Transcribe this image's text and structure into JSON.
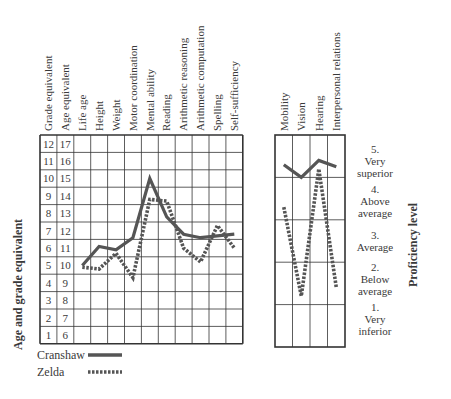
{
  "chart_data": [
    {
      "type": "line",
      "title": "",
      "ylabel": "Age and grade equivalent",
      "y_axis_grade_ticks": [
        "12",
        "11",
        "10",
        "9",
        "8",
        "7",
        "6",
        "5",
        "4",
        "3",
        "2",
        "1"
      ],
      "y_axis_age_ticks": [
        "17",
        "16",
        "15",
        "14",
        "13",
        "12",
        "11",
        "10",
        "9",
        "8",
        "7",
        "6"
      ],
      "categories": [
        "Life age",
        "Height",
        "Weight",
        "Motor coordination",
        "Mental ability",
        "Reading",
        "Arithmetic reasoning",
        "Arithmetic computation",
        "Spelling",
        "Self-sufficiency"
      ],
      "column_headers": [
        "Grade equivalent",
        "Age equivalent",
        "Life age",
        "Height",
        "Weight",
        "Motor coordination",
        "Mental ability",
        "Reading",
        "Arithmetic reasoning",
        "Arithmetic computation",
        "Spelling",
        "Self-sufficiency"
      ],
      "ylim_age": [
        5.5,
        17.5
      ],
      "series": [
        {
          "name": "Cranshaw",
          "style": "solid",
          "values": [
            10.0,
            11.1,
            10.9,
            11.6,
            15.0,
            12.8,
            11.8,
            11.6,
            11.7,
            11.8
          ]
        },
        {
          "name": "Zelda",
          "style": "dashed",
          "values": [
            9.9,
            9.8,
            10.7,
            9.3,
            13.8,
            13.7,
            11.0,
            10.2,
            12.3,
            11.0
          ]
        }
      ],
      "grid": true,
      "legend_position": "bottom-left"
    },
    {
      "type": "line",
      "ylabel": "Proficiency level",
      "categories": [
        "Mobility",
        "Vision",
        "Hearing",
        "Interpersonal relations"
      ],
      "levels": [
        {
          "num": "5.",
          "label": [
            "Very",
            "superior"
          ]
        },
        {
          "num": "4.",
          "label": [
            "Above",
            "average"
          ]
        },
        {
          "num": "3.",
          "label": [
            "Average"
          ]
        },
        {
          "num": "2.",
          "label": [
            "Below",
            "average"
          ]
        },
        {
          "num": "1.",
          "label": [
            "Very",
            "inferior"
          ]
        }
      ],
      "series": [
        {
          "name": "Cranshaw",
          "style": "solid",
          "values": [
            4.8,
            4.5,
            4.9,
            4.75
          ]
        },
        {
          "name": "Zelda",
          "style": "dashed",
          "values": [
            3.8,
            1.7,
            4.7,
            1.9
          ]
        }
      ],
      "ylim": [
        0.5,
        5.5
      ],
      "grid": true
    }
  ],
  "legend": [
    {
      "label": "Cranshaw",
      "style": "solid"
    },
    {
      "label": "Zelda",
      "style": "dashed"
    }
  ],
  "colors": {
    "line": "#555555",
    "grid": "#333333",
    "text": "#3a3a3a"
  }
}
